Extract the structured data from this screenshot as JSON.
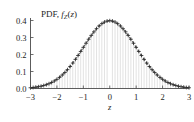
{
  "chart_data": {
    "type": "line",
    "title_parts": {
      "prefix": "PDF, ",
      "func": "f",
      "subscript": "Z",
      "open": "(",
      "arg": "z",
      "close": ")"
    },
    "xlabel": "z",
    "ylabel": "",
    "xlim": [
      -3,
      3
    ],
    "ylim": [
      0.0,
      0.4
    ],
    "grid": false,
    "legend": null,
    "xticks": [
      -3,
      -2,
      -1,
      0,
      1,
      2,
      3
    ],
    "xtick_labels": [
      "−3",
      "−2",
      "−1",
      "0",
      "1",
      "2",
      "3"
    ],
    "yticks": [
      0.0,
      0.1,
      0.2,
      0.3,
      0.4
    ],
    "ytick_labels": [
      "0.0",
      "0.1",
      "0.2",
      "0.3",
      "0.4"
    ],
    "series": [
      {
        "name": "theoretical-normal-pdf",
        "style": "dashed-line",
        "color": "#555555",
        "x": [
          -3.0,
          -2.8,
          -2.6,
          -2.4,
          -2.2,
          -2.0,
          -1.8,
          -1.6,
          -1.4,
          -1.2,
          -1.0,
          -0.8,
          -0.6,
          -0.4,
          -0.2,
          0.0,
          0.2,
          0.4,
          0.6,
          0.8,
          1.0,
          1.2,
          1.4,
          1.6,
          1.8,
          2.0,
          2.2,
          2.4,
          2.6,
          2.8,
          3.0
        ],
        "values": [
          0.0044,
          0.0079,
          0.0136,
          0.0224,
          0.0355,
          0.054,
          0.079,
          0.1109,
          0.1497,
          0.1942,
          0.242,
          0.2897,
          0.3332,
          0.3683,
          0.391,
          0.3989,
          0.391,
          0.3683,
          0.3332,
          0.2897,
          0.242,
          0.1942,
          0.1497,
          0.1109,
          0.079,
          0.054,
          0.0355,
          0.0224,
          0.0136,
          0.0079,
          0.0044
        ]
      },
      {
        "name": "empirical-estimate-markers",
        "style": "plus-markers-with-stems",
        "color": "#2b2b2b",
        "stem_color": "#c9c9c9",
        "x": [
          -3.0,
          -2.9,
          -2.8,
          -2.7,
          -2.6,
          -2.5,
          -2.4,
          -2.3,
          -2.2,
          -2.1,
          -2.0,
          -1.9,
          -1.8,
          -1.7,
          -1.6,
          -1.5,
          -1.4,
          -1.3,
          -1.2,
          -1.1,
          -1.0,
          -0.9,
          -0.8,
          -0.7,
          -0.6,
          -0.5,
          -0.4,
          -0.3,
          -0.2,
          -0.1,
          0.0,
          0.1,
          0.2,
          0.3,
          0.4,
          0.5,
          0.6,
          0.7,
          0.8,
          0.9,
          1.0,
          1.1,
          1.2,
          1.3,
          1.4,
          1.5,
          1.6,
          1.7,
          1.8,
          1.9,
          2.0,
          2.1,
          2.2,
          2.3,
          2.4,
          2.5,
          2.6,
          2.7,
          2.8,
          2.9,
          3.0
        ],
        "values": [
          0.0044,
          0.006,
          0.0079,
          0.0104,
          0.0136,
          0.0175,
          0.0224,
          0.0283,
          0.0355,
          0.044,
          0.054,
          0.0656,
          0.079,
          0.094,
          0.1109,
          0.1295,
          0.1497,
          0.1714,
          0.1942,
          0.2179,
          0.242,
          0.2661,
          0.2897,
          0.3123,
          0.3332,
          0.3521,
          0.3683,
          0.3814,
          0.391,
          0.397,
          0.3989,
          0.397,
          0.391,
          0.3814,
          0.3683,
          0.3521,
          0.3332,
          0.3123,
          0.2897,
          0.2661,
          0.242,
          0.2179,
          0.1942,
          0.1714,
          0.1497,
          0.1295,
          0.1109,
          0.094,
          0.079,
          0.0656,
          0.054,
          0.044,
          0.0355,
          0.0283,
          0.0224,
          0.0175,
          0.0136,
          0.0104,
          0.0079,
          0.006,
          0.0044
        ]
      }
    ],
    "colors": {
      "curve": "#555555",
      "marker": "#2b2b2b",
      "stem": "#c9c9c9",
      "axis": "#4a4a4a",
      "text": "#1d1d1d",
      "background": "#ffffff"
    }
  }
}
